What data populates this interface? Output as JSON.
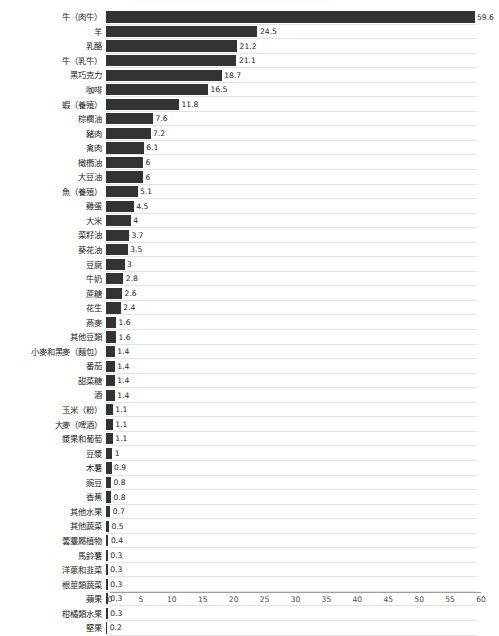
{
  "chart_data": {
    "type": "bar",
    "orientation": "horizontal",
    "title": "",
    "xlabel": "",
    "ylabel": "",
    "xlim": [
      0,
      60
    ],
    "xticks": [
      0,
      5,
      10,
      15,
      20,
      25,
      30,
      35,
      40,
      45,
      50,
      55,
      60
    ],
    "grid": true,
    "grid_axis": "y-rows",
    "legend": false,
    "bar_color": "#333333",
    "gridline_color": "#e3e3e3",
    "axis_color": "#9d9d9d",
    "categories": [
      "牛（肉牛）",
      "羊",
      "乳酪",
      "牛（乳牛）",
      "黑巧克力",
      "咖啡",
      "蝦（養殖）",
      "棕櫚油",
      "豬肉",
      "禽肉",
      "橄欖油",
      "大豆油",
      "魚（養殖）",
      "雞蛋",
      "大米",
      "菜籽油",
      "葵花油",
      "豆腐",
      "牛奶",
      "蔗糖",
      "花生",
      "燕麥",
      "其他豆類",
      "小麥和黑麥（麵包）",
      "番茄",
      "甜菜糖",
      "酒",
      "玉米（粉）",
      "大麥（啤酒）",
      "漿果和葡萄",
      "豆漿",
      "木薯",
      "豌豆",
      "香蕉",
      "其他水果",
      "其他蔬菜",
      "蕓薹屬植物",
      "馬鈴薯",
      "洋蔥和韭菜",
      "根莖類蔬菜",
      "蘋果",
      "柑橘類水果",
      "堅果"
    ],
    "values": [
      59.6,
      24.5,
      21.2,
      21.1,
      18.7,
      16.5,
      11.8,
      7.6,
      7.2,
      6.1,
      6,
      6,
      5.1,
      4.5,
      4,
      3.7,
      3.5,
      3,
      2.8,
      2.6,
      2.4,
      1.6,
      1.6,
      1.4,
      1.4,
      1.4,
      1.4,
      1.1,
      1.1,
      1.1,
      1,
      0.9,
      0.8,
      0.8,
      0.7,
      0.5,
      0.4,
      0.3,
      0.3,
      0.3,
      0.3,
      0.3,
      0.2
    ],
    "value_labels": [
      "59.6",
      "24.5",
      "21.2",
      "21.1",
      "18.7",
      "16.5",
      "11.8",
      "7.6",
      "7.2",
      "6.1",
      "6",
      "6",
      "5.1",
      "4.5",
      "4",
      "3.7",
      "3.5",
      "3",
      "2.8",
      "2.6",
      "2.4",
      "1.6",
      "1.6",
      "1.4",
      "1.4",
      "1.4",
      "1.4",
      "1.1",
      "1.1",
      "1.1",
      "1",
      "0.9",
      "0.8",
      "0.8",
      "0.7",
      "0.5",
      "0.4",
      "0.3",
      "0.3",
      "0.3",
      "0.3",
      "0.3",
      "0.2"
    ]
  }
}
